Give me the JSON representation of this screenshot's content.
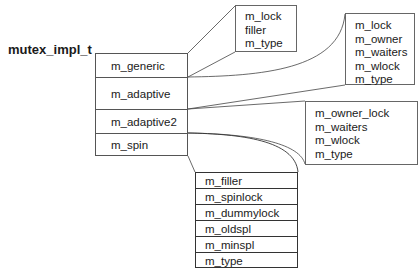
{
  "title": "mutex_impl_t",
  "struct_fields": [
    {
      "label": "m_generic"
    },
    {
      "label": "m_adaptive"
    },
    {
      "label": "m_adaptive2"
    },
    {
      "label": "m_spin"
    }
  ],
  "generic_box": {
    "fields": [
      "m_lock",
      "filler",
      "m_type"
    ]
  },
  "adaptive_box": {
    "fields": [
      "m_lock",
      "m_owner",
      "m_waiters",
      "m_wlock",
      "m_type"
    ]
  },
  "adaptive2_box": {
    "fields": [
      "m_owner_lock",
      "m_waiters",
      "m_wlock",
      "m_type"
    ]
  },
  "spin_box": {
    "fields": [
      "m_filler",
      "m_spinlock",
      "m_dummylock",
      "m_oldspl",
      "m_minspl",
      "m_type"
    ]
  }
}
